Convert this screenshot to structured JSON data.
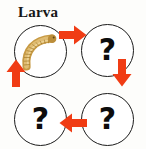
{
  "diagram": {
    "title": "Larva",
    "background_color": "#fdfdfb",
    "accent_color": "#f03c14",
    "outline_color": "#1b1b1b",
    "larva_color": "#cfa24a",
    "stages": [
      {
        "id": "larva",
        "label": "",
        "position": "top-left",
        "has_image": "larva-illustration"
      },
      {
        "id": "unknown-1",
        "label": "?",
        "position": "top-right",
        "has_image": ""
      },
      {
        "id": "unknown-2",
        "label": "?",
        "position": "bottom-right",
        "has_image": ""
      },
      {
        "id": "unknown-3",
        "label": "?",
        "position": "bottom-left",
        "has_image": ""
      }
    ],
    "arrows": [
      {
        "id": "arrow-top",
        "direction": "right",
        "from": "larva",
        "to": "unknown-1"
      },
      {
        "id": "arrow-right",
        "direction": "down",
        "from": "unknown-1",
        "to": "unknown-2"
      },
      {
        "id": "arrow-bottom",
        "direction": "left",
        "from": "unknown-2",
        "to": "unknown-3"
      },
      {
        "id": "arrow-left",
        "direction": "up",
        "from": "unknown-3",
        "to": "larva"
      }
    ]
  }
}
